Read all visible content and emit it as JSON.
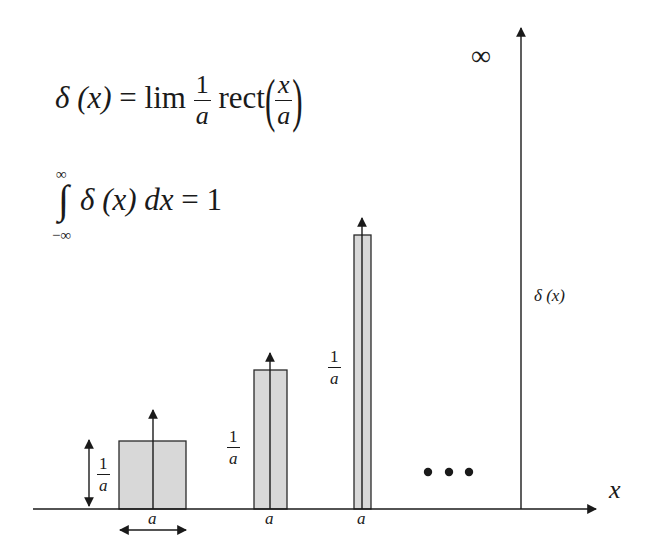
{
  "formulas": {
    "definition": {
      "lhs": "δ (x)",
      "equals": "=",
      "lim": "lim",
      "frac_num": "1",
      "frac_den": "a",
      "func": "rect",
      "arg_num": "x",
      "arg_den": "a"
    },
    "integral": {
      "upper": "∞",
      "lower": "−∞",
      "sign": "∫",
      "integrand": "δ (x) d",
      "var": "x",
      "rhs": "= 1"
    }
  },
  "axes": {
    "x_label": "x",
    "y_label": "δ (x)",
    "y_top_label": "∞"
  },
  "pulses": [
    {
      "width_label": "a",
      "height_label_num": "1",
      "height_label_den": "a",
      "x": 119,
      "w": 67,
      "top": 441
    },
    {
      "width_label": "a",
      "height_label_num": "1",
      "height_label_den": "a",
      "x": 254,
      "w": 33,
      "top": 370
    },
    {
      "width_label": "a",
      "height_label_num": "1",
      "height_label_den": "a",
      "x": 354,
      "w": 17,
      "top": 235
    }
  ],
  "ellipsis": "• • •",
  "colors": {
    "stroke": "#2a2a2a",
    "fill": "#d8d8d8",
    "background": "#ffffff"
  }
}
